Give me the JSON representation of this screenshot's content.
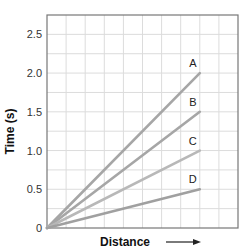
{
  "chart_data": {
    "type": "line",
    "title": "",
    "xlabel": "Distance",
    "xlabel_arrow": "right-arrow",
    "ylabel": "Time (s)",
    "ylim": [
      0,
      2.75
    ],
    "xlim": [
      0,
      10
    ],
    "y_ticks": [
      0,
      0.5,
      1.0,
      1.5,
      2.0,
      2.5
    ],
    "y_tick_labels": [
      "0",
      "0.5",
      "1.0",
      "1.5",
      "2.0",
      "2.5"
    ],
    "x_ticks": [],
    "grid": true,
    "grid_step_x": 1,
    "grid_step_y": 0.25,
    "legend": "inline-labels",
    "series": [
      {
        "name": "A",
        "x": [
          0,
          8
        ],
        "y": [
          0,
          2.0
        ],
        "color": "#a6a6a6"
      },
      {
        "name": "B",
        "x": [
          0,
          8
        ],
        "y": [
          0,
          1.5
        ],
        "color": "#a6a6a6"
      },
      {
        "name": "C",
        "x": [
          0,
          8
        ],
        "y": [
          0,
          1.0
        ],
        "color": "#b8b8b8"
      },
      {
        "name": "D",
        "x": [
          0,
          8
        ],
        "y": [
          0,
          0.5
        ],
        "color": "#a0a0a0"
      }
    ]
  }
}
